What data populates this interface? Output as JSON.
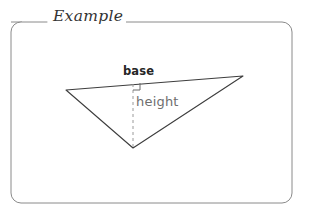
{
  "figure": {
    "title": "Example",
    "panel": {
      "border_color": "#8a8a8a",
      "background_color": "#ffffff",
      "corner_radius": 10,
      "x": 11,
      "y": 22,
      "width": 281,
      "height": 181
    },
    "title_gap": {
      "left": 47,
      "right": 118
    },
    "diagram": {
      "type": "triangle-base-height",
      "stroke_color": "#3d3d3d",
      "dash_color": "#9a9a9a",
      "vertices": [
        {
          "name": "left-vertex",
          "x": 66,
          "y": 90
        },
        {
          "name": "right-vertex",
          "x": 243,
          "y": 76
        },
        {
          "name": "bottom-vertex",
          "x": 133,
          "y": 148
        }
      ],
      "height_line": {
        "x": 133,
        "y1": 84,
        "y2": 148
      },
      "right_angle_marker": {
        "x": 130,
        "y": 83,
        "size": 7
      },
      "labels": {
        "base": "base",
        "height": "height"
      }
    }
  }
}
